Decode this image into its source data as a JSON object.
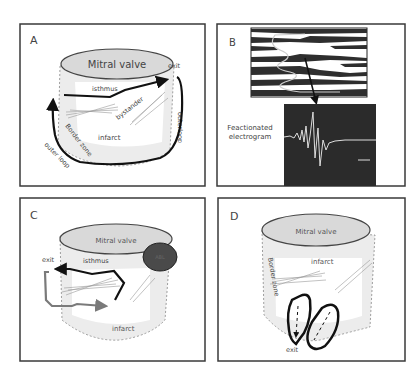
{
  "figure": {
    "panels": {
      "A": {
        "letter": "A",
        "valve_label": "Mitral valve",
        "exit_label": "exit",
        "isthmus_label": "isthmus",
        "bystander_label": "bystander",
        "outer_loop_right_label": "outerloop",
        "border_zone_label": "Border zone",
        "infarct_label": "infarct",
        "outer_loop_left_label": "outer loop"
      },
      "B": {
        "letter": "B",
        "electrogram_label_line1": "Feactionated",
        "electrogram_label_line2": "electrogram"
      },
      "C": {
        "letter": "C",
        "valve_label": "Mitral valve",
        "exit_label": "exit",
        "isthmus_label": "isthmus",
        "ablation_label": "ABL",
        "infarct_label": "infarct"
      },
      "D": {
        "letter": "D",
        "valve_label": "Mitral valve",
        "infarct_label": "infarct",
        "border_zone_label": "Border zone",
        "exit_label": "exit"
      }
    },
    "colors": {
      "frame": "#3a3a3a",
      "valve_fill": "#d9d9d9",
      "tissue_fill": "#ececec",
      "infarct_fill": "#ffffff",
      "arrow_dark": "#111111",
      "arrow_grey": "#7a7a7a",
      "ablation_fill": "#4a4a4a",
      "electrogram_bg": "#2b2b2b",
      "text": "#444444"
    }
  }
}
